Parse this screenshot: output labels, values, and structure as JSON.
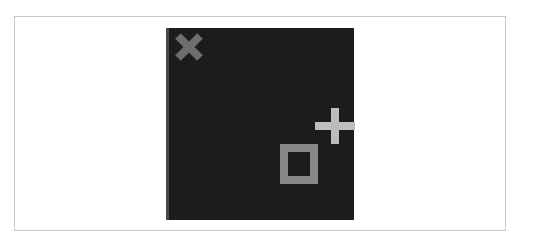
{
  "board": {
    "background": "#1c1c1c",
    "pieces": [
      {
        "type": "x",
        "color": "#6e6e6e"
      },
      {
        "type": "plus",
        "color": "#bdbdbd"
      },
      {
        "type": "square",
        "color": "#888888"
      }
    ]
  }
}
